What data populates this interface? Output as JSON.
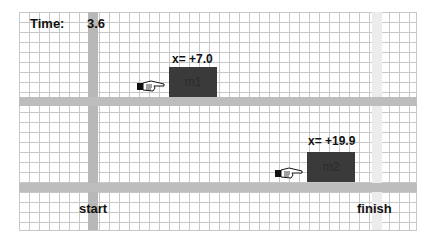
{
  "hud": {
    "time_label": "Time:",
    "time_value": "3.6"
  },
  "track": {
    "start_label": "start",
    "finish_label": "finish"
  },
  "masses": [
    {
      "name": "m1",
      "position_label": "x= +7.0"
    },
    {
      "name": "m2",
      "position_label": "x= +19.9"
    }
  ],
  "colors": {
    "grid": "#c8c8c8",
    "track": "#bdbdbd",
    "start_bar": "#b8b8b8",
    "finish_bar": "#ececec",
    "mass": "#3a3a3a"
  }
}
